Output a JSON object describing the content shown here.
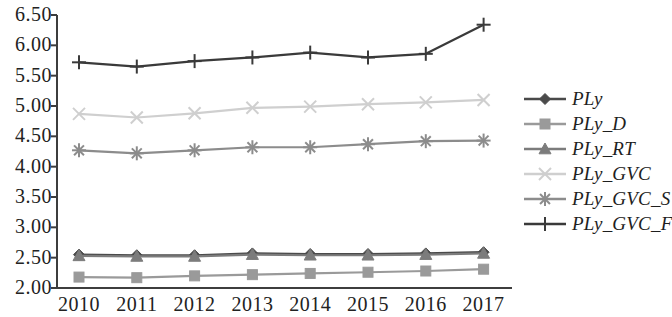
{
  "chart_data": {
    "type": "line",
    "title": "",
    "subtitle": "",
    "xlabel": "",
    "ylabel": "",
    "grid": false,
    "legend_position": "right",
    "categories": [
      "2010",
      "2011",
      "2012",
      "2013",
      "2014",
      "2015",
      "2016",
      "2017"
    ],
    "x": [
      2010,
      2011,
      2012,
      2013,
      2014,
      2015,
      2016,
      2017
    ],
    "ylim": [
      2.0,
      6.5
    ],
    "yticks": [
      "2.00",
      "2.50",
      "3.00",
      "3.50",
      "4.00",
      "4.50",
      "5.00",
      "5.50",
      "6.00",
      "6.50"
    ],
    "ytick_values": [
      2.0,
      2.5,
      3.0,
      3.5,
      4.0,
      4.5,
      5.0,
      5.5,
      6.0,
      6.5
    ],
    "series": [
      {
        "name": "PLy",
        "marker": "diamond",
        "color": "#4a4a4a",
        "values": [
          2.55,
          2.54,
          2.54,
          2.57,
          2.56,
          2.56,
          2.57,
          2.59
        ]
      },
      {
        "name": "PLy_D",
        "marker": "square",
        "color": "#9a9a9a",
        "values": [
          2.18,
          2.17,
          2.2,
          2.22,
          2.24,
          2.26,
          2.28,
          2.31
        ]
      },
      {
        "name": "PLy_RT",
        "marker": "triangle",
        "color": "#7c7c7c",
        "values": [
          2.53,
          2.52,
          2.52,
          2.55,
          2.54,
          2.54,
          2.55,
          2.57
        ]
      },
      {
        "name": "PLy_GVC",
        "marker": "x",
        "color": "#cfcfcf",
        "values": [
          4.87,
          4.81,
          4.88,
          4.97,
          4.99,
          5.03,
          5.06,
          5.1
        ]
      },
      {
        "name": "PLy_GVC_S",
        "marker": "asterisk",
        "color": "#8c8c8c",
        "values": [
          4.27,
          4.22,
          4.27,
          4.32,
          4.32,
          4.37,
          4.42,
          4.43
        ]
      },
      {
        "name": "PLy_GVC_F",
        "marker": "plus",
        "color": "#3a3a3a",
        "values": [
          5.72,
          5.65,
          5.74,
          5.8,
          5.88,
          5.8,
          5.86,
          6.34
        ]
      }
    ]
  },
  "legend": {
    "items": [
      {
        "label": "PLy",
        "marker": "diamond-marker",
        "color": "#4a4a4a"
      },
      {
        "label": "PLy_D",
        "marker": "square-marker",
        "color": "#9a9a9a"
      },
      {
        "label": "PLy_RT",
        "marker": "triangle-marker",
        "color": "#7c7c7c"
      },
      {
        "label": "PLy_GVC",
        "marker": "x-marker",
        "color": "#cfcfcf"
      },
      {
        "label": "PLy_GVC_S",
        "marker": "asterisk-marker",
        "color": "#8c8c8c"
      },
      {
        "label": "PLy_GVC_F",
        "marker": "plus-marker",
        "color": "#3a3a3a"
      }
    ]
  },
  "axes": {
    "axis_color": "#3d3d3d",
    "y_labels": [
      "6.50",
      "6.00",
      "5.50",
      "5.00",
      "4.50",
      "4.00",
      "3.50",
      "3.00",
      "2.50",
      "2.00"
    ],
    "x_labels": [
      "2010",
      "2011",
      "2012",
      "2013",
      "2014",
      "2015",
      "2016",
      "2017"
    ]
  }
}
